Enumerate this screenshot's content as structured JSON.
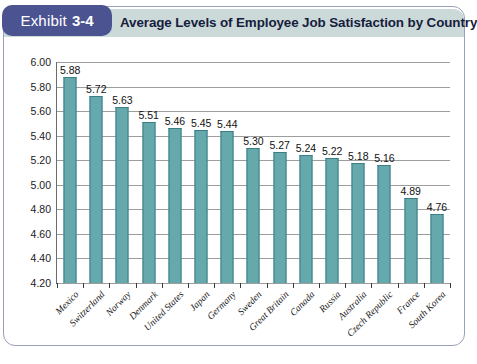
{
  "exhibit": {
    "badge_word": "Exhibit",
    "badge_number": "3-4",
    "title": "Average Levels of Employee Job Satisfaction by Country"
  },
  "colors": {
    "badge_bg": "#4b5390",
    "header_band": "#ccd9d9",
    "bar_fill": "#65a9ad",
    "bar_stroke": "#3b7f84",
    "title_text": "#16203c"
  },
  "chart_data": {
    "type": "bar",
    "title": "Average Levels of Employee Job Satisfaction by Country",
    "xlabel": "",
    "ylabel": "",
    "ylim": [
      4.2,
      6.0
    ],
    "ytick_step": 0.2,
    "yticks": [
      "6.00",
      "5.80",
      "5.60",
      "5.40",
      "5.20",
      "5.00",
      "4.80",
      "4.60",
      "4.40",
      "4.20"
    ],
    "grid": "horizontal",
    "legend": "none",
    "categories": [
      "Mexico",
      "Switzerland",
      "Norway",
      "Denmark",
      "United States",
      "Japan",
      "Germany",
      "Sweden",
      "Great Britain",
      "Canada",
      "Russia",
      "Australia",
      "Czech Republic",
      "France",
      "South Korea"
    ],
    "values": [
      5.88,
      5.72,
      5.63,
      5.51,
      5.46,
      5.45,
      5.44,
      5.3,
      5.27,
      5.24,
      5.22,
      5.18,
      5.16,
      4.89,
      4.76
    ],
    "value_labels": [
      "5.88",
      "5.72",
      "5.63",
      "5.51",
      "5.46",
      "5.45",
      "5.44",
      "5.30",
      "5.27",
      "5.24",
      "5.22",
      "5.18",
      "5.16",
      "4.89",
      "4.76"
    ]
  }
}
